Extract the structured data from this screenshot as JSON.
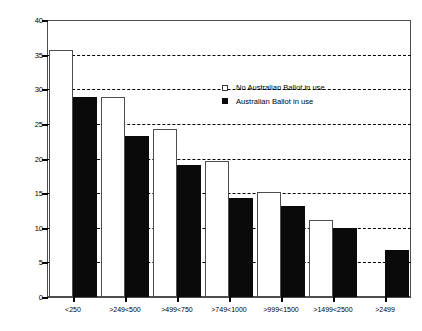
{
  "chart_data": {
    "type": "bar",
    "title": "",
    "xlabel": "",
    "ylabel": "Percentage of Registered Voters in Attendance",
    "ylim": [
      0,
      40
    ],
    "yticks": [
      0,
      5,
      10,
      15,
      20,
      25,
      30,
      35,
      40
    ],
    "ytick_labels": [
      "0",
      "5",
      "10",
      "15",
      "20",
      "25",
      "30",
      "35",
      "40"
    ],
    "grid": true,
    "grid_axis": "y",
    "legend_position": "inside upper right",
    "categories": [
      "<250",
      ">249<500",
      ">499<750",
      ">749<1000",
      ">999<1500",
      ">1499<2500",
      ">2499"
    ],
    "series": [
      {
        "name": "No Australian Ballot in use",
        "style": "open",
        "color": "#ffffff",
        "edge_color": "#4d4d4d",
        "values": [
          35.6,
          28.9,
          24.3,
          19.7,
          15.2,
          11.1,
          null
        ]
      },
      {
        "name": "Australian Ballot in use",
        "style": "filled",
        "color": "#0a0a0a",
        "edge_color": "#0a0a0a",
        "values": [
          28.9,
          23.3,
          19.0,
          14.3,
          13.2,
          10.0,
          6.8
        ]
      }
    ]
  },
  "legend": {
    "items": [
      {
        "label": "No Australian Ballot in use",
        "style": "open"
      },
      {
        "label": "Australian Ballot in use",
        "style": "filled"
      }
    ]
  }
}
